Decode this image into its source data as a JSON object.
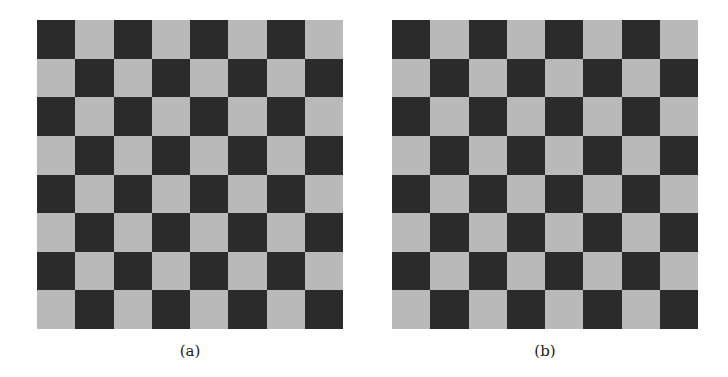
{
  "figure": {
    "panels": [
      {
        "id": "a",
        "caption": "(a)",
        "rows": 8,
        "cols": 8,
        "top_left": "dark"
      },
      {
        "id": "b",
        "caption": "(b)",
        "rows": 8,
        "cols": 8,
        "top_left": "dark"
      }
    ],
    "colors": {
      "dark": "#2b2b2b",
      "light": "#b9b9b9",
      "background": "#ffffff"
    }
  }
}
